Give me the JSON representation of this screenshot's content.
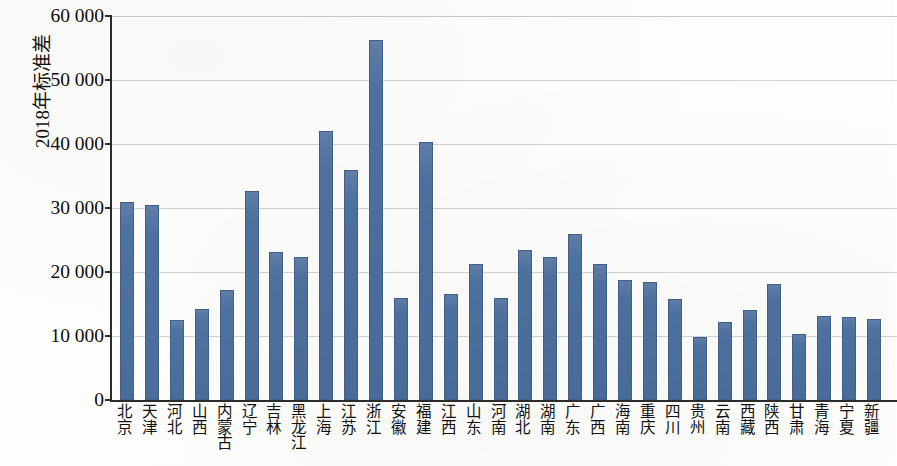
{
  "chart_data": {
    "type": "bar",
    "title": "",
    "subtitle": "",
    "xlabel": "",
    "ylabel": "2018年标准差",
    "ylim": [
      0,
      60000
    ],
    "ytick_step": 10000,
    "ytick_labels": [
      "60 000",
      "50 000",
      "40 000",
      "30 000",
      "20 000",
      "10 000",
      "0"
    ],
    "ytick_values": [
      60000,
      50000,
      40000,
      30000,
      20000,
      10000,
      0
    ],
    "grid": true,
    "legend": false,
    "bar_color": "#4e71a0",
    "bar_border_color": "#415f8a",
    "axis_color": "#2b2b2b",
    "gridline_color": "#d2d2d2",
    "categories": [
      "北京",
      "天津",
      "河北",
      "山西",
      "内蒙古",
      "辽宁",
      "吉林",
      "黑龙江",
      "上海",
      "江苏",
      "浙江",
      "安徽",
      "福建",
      "江西",
      "山东",
      "河南",
      "湖北",
      "湖南",
      "广东",
      "广西",
      "海南",
      "重庆",
      "四川",
      "贵州",
      "云南",
      "西藏",
      "陕西",
      "甘肃",
      "青海",
      "宁夏",
      "新疆"
    ],
    "values": [
      31000,
      30500,
      12500,
      14200,
      17200,
      32600,
      23200,
      22400,
      42000,
      36000,
      56300,
      15900,
      40300,
      16500,
      21200,
      15900,
      23400,
      22400,
      26000,
      21200,
      18700,
      18400,
      15800,
      9900,
      12200,
      14100,
      18100,
      10300,
      13100,
      12900,
      12600
    ]
  }
}
